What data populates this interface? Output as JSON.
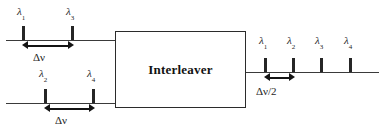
{
  "diagram": {
    "device": {
      "label": "Interleaver"
    },
    "symbols": {
      "lambda": "λ",
      "delta": "Δ",
      "nu": "ν"
    },
    "inputs": [
      {
        "name": "upper-input-port",
        "channels": [
          {
            "label": "λ",
            "subscript": "1"
          },
          {
            "label": "λ",
            "subscript": "3"
          }
        ],
        "spacing_label": "Δν",
        "spacing_value": "Δν"
      },
      {
        "name": "lower-input-port",
        "channels": [
          {
            "label": "λ",
            "subscript": "2"
          },
          {
            "label": "λ",
            "subscript": "4"
          }
        ],
        "spacing_label": "Δν",
        "spacing_value": "Δν"
      }
    ],
    "output": {
      "name": "output-port",
      "channels": [
        {
          "label": "λ",
          "subscript": "1"
        },
        {
          "label": "λ",
          "subscript": "2"
        },
        {
          "label": "λ",
          "subscript": "3"
        },
        {
          "label": "λ",
          "subscript": "4"
        }
      ],
      "spacing_label": "Δν/2",
      "spacing_value": "Δν/2"
    },
    "colors": {
      "line": "#3a3a3a",
      "spike": "#262626",
      "text": "#1f1f1f",
      "box_border": "#2b2b2b",
      "background": "#ffffff"
    }
  }
}
